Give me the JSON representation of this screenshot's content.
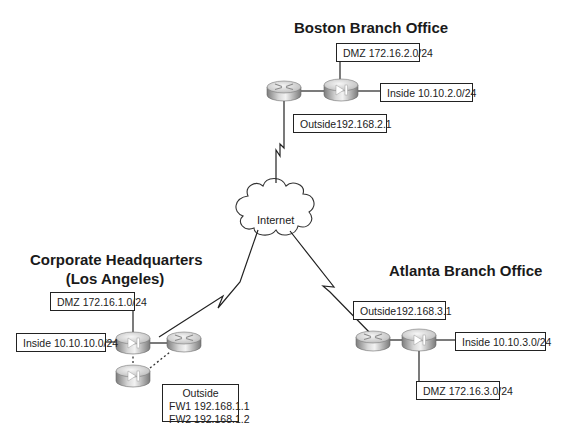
{
  "diagram": {
    "type": "network-topology",
    "sites": {
      "boston": {
        "title": "Boston Branch Office",
        "labels": {
          "dmz": "DMZ 172.16.2.0/24",
          "inside": "Inside 10.10.2.0/24",
          "outside": "Outside192.168.2.1"
        },
        "devices": [
          "router",
          "firewall"
        ]
      },
      "hq": {
        "title_line1": "Corporate Headquarters",
        "title_line2": "(Los Angeles)",
        "labels": {
          "dmz": "DMZ 172.16.1.0/24",
          "inside": "Inside 10.10.10.0/24",
          "outside_line1": "Outside",
          "outside_line2": "FW1 192.168.1.1",
          "outside_line3": "FW2 192.168.1.2"
        },
        "devices": [
          "firewall-primary",
          "firewall-failover",
          "router"
        ]
      },
      "atlanta": {
        "title": "Atlanta Branch Office",
        "labels": {
          "outside": "Outside192.168.3.1",
          "inside": "Inside 10.10.3.0/24",
          "dmz": "DMZ 172.16.3.0/24"
        },
        "devices": [
          "router",
          "firewall"
        ]
      }
    },
    "cloud": {
      "label": "Internet"
    },
    "links": [
      {
        "from": "boston-router",
        "to": "internet",
        "type": "serial-wan"
      },
      {
        "from": "hq-router",
        "to": "internet",
        "type": "serial-wan"
      },
      {
        "from": "atlanta-router",
        "to": "internet",
        "type": "serial-wan"
      },
      {
        "from": "hq-fw1",
        "to": "hq-fw2",
        "type": "failover-dashed"
      },
      {
        "from": "hq-fw2",
        "to": "hq-router",
        "type": "failover-dashed"
      }
    ],
    "colors": {
      "line": "#222222",
      "device_light": "#e8e8e8",
      "device_dark": "#8a8a8a",
      "background": "#ffffff"
    }
  }
}
